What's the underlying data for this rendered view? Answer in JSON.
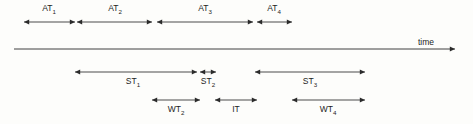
{
  "figure": {
    "type": "timing-diagram",
    "background_color": "#fdfdfb",
    "line_color": "#2b2b2b",
    "width": 473,
    "height": 124
  },
  "axis": {
    "label": "time",
    "label_x": 426,
    "label_y": 45,
    "line_y": 49,
    "x_start": 14,
    "x_end": 455,
    "arrow": "right"
  },
  "rows": [
    {
      "name": "arrival-times",
      "line_y": 22,
      "label_y": 11,
      "label_position": "above",
      "segments": [
        {
          "id": "AT1",
          "base": "AT",
          "sub": "1",
          "x_start": 24,
          "x_end": 75,
          "label_x": 49,
          "arrow": "both"
        },
        {
          "id": "AT2",
          "base": "AT",
          "sub": "2",
          "x_start": 77,
          "x_end": 152,
          "label_x": 115,
          "arrow": "both"
        },
        {
          "id": "AT3",
          "base": "AT",
          "sub": "3",
          "x_start": 157,
          "x_end": 253,
          "label_x": 205,
          "arrow": "both"
        },
        {
          "id": "AT4",
          "base": "AT",
          "sub": "4",
          "x_start": 257,
          "x_end": 292,
          "label_x": 274,
          "arrow": "both"
        }
      ]
    },
    {
      "name": "service-times",
      "line_y": 72,
      "label_y": 84,
      "label_position": "below",
      "segments": [
        {
          "id": "ST1",
          "base": "ST",
          "sub": "1",
          "x_start": 75,
          "x_end": 197,
          "label_x": 133,
          "arrow": "both"
        },
        {
          "id": "ST2",
          "base": "ST",
          "sub": "2",
          "x_start": 200,
          "x_end": 216,
          "label_x": 208,
          "arrow": "both"
        },
        {
          "id": "ST3",
          "base": "ST",
          "sub": "3",
          "x_start": 255,
          "x_end": 365,
          "label_x": 310,
          "arrow": "both"
        }
      ]
    },
    {
      "name": "wait-and-idle-times",
      "line_y": 100,
      "label_y": 112,
      "label_position": "below",
      "segments": [
        {
          "id": "WT2",
          "base": "WT",
          "sub": "2",
          "x_start": 152,
          "x_end": 200,
          "label_x": 176,
          "arrow": "both"
        },
        {
          "id": "IT",
          "base": "IT",
          "sub": "",
          "x_start": 215,
          "x_end": 257,
          "label_x": 236,
          "arrow": "both"
        },
        {
          "id": "WT4",
          "base": "WT",
          "sub": "4",
          "x_start": 292,
          "x_end": 365,
          "label_x": 328,
          "arrow": "both"
        }
      ]
    }
  ]
}
